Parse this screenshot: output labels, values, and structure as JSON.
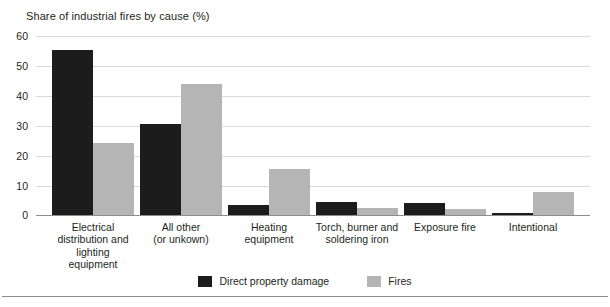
{
  "chart_data": {
    "type": "bar",
    "title": "Share of industrial fires by cause (%)",
    "xlabel": "",
    "ylabel": "",
    "ylim": [
      0,
      60
    ],
    "yticks": [
      "0",
      "10",
      "20",
      "30",
      "40",
      "50",
      "60"
    ],
    "grid": true,
    "legend_position": "bottom-center",
    "categories": [
      "Electrical\ndistribution and\nlighting\nequipment",
      "All other\n(or unkown)",
      "Heating\nequipment",
      "Torch, burner and\nsoldering iron",
      "Exposure fire",
      "Intentional"
    ],
    "category_lines": [
      [
        "Electrical",
        "distribution and",
        "lighting",
        "equipment"
      ],
      [
        "All other",
        "(or unkown)"
      ],
      [
        "Heating",
        "equipment"
      ],
      [
        "Torch, burner and",
        "soldering iron"
      ],
      [
        "Exposure fire"
      ],
      [
        "Intentional"
      ]
    ],
    "series": [
      {
        "name": "Direct property damage",
        "color": "#1c1c1c",
        "values": [
          55.3,
          30.5,
          3.5,
          4.4,
          4.1,
          0.6
        ]
      },
      {
        "name": "Fires",
        "color": "#b5b5b5",
        "values": [
          24.0,
          44.0,
          15.5,
          2.4,
          2.1,
          7.6
        ]
      }
    ]
  },
  "legend": {
    "items": [
      {
        "label": "Direct property damage",
        "swatch": "dark"
      },
      {
        "label": "Fires",
        "swatch": "light"
      }
    ]
  }
}
